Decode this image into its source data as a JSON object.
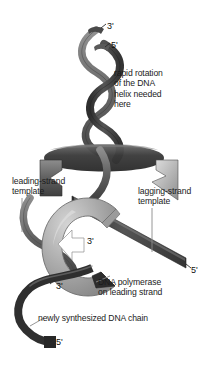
{
  "figure": {
    "background_color": "#ffffff",
    "colors": {
      "ribbon_dark": "#3b3b3b",
      "ribbon_mid": "#6e6e6e",
      "ribbon_light": "#c6c6c6",
      "polymerase_fill": "#a9a9a9",
      "polymerase_highlight": "#cfcfcf",
      "leader_line": "#8a8a8a",
      "text": "#1b1b1b"
    }
  },
  "labels": {
    "rapid_rotation": "rapid rotation\nof the DNA\nhelix needed\nhere",
    "leading_strand_template": "leading-strand\ntemplate",
    "lagging_strand_template": "lagging-strand\ntemplate",
    "dna_polymerase": "DNA polymerase\non leading strand",
    "newly_synthesized": "newly synthesized DNA chain"
  },
  "end_markers": {
    "top_three_prime": "3'",
    "top_five_prime": "5'",
    "polymerase_three_prime": "3'",
    "lagging_five_prime": "5'",
    "lower_three_prime": "3'",
    "lower_five_prime": "5'"
  },
  "icons": {
    "double_helix": "dna-double-helix-icon",
    "polymerase": "dna-polymerase-clamp-icon",
    "arrow": "direction-arrow-icon",
    "leader": "leader-line-icon"
  }
}
